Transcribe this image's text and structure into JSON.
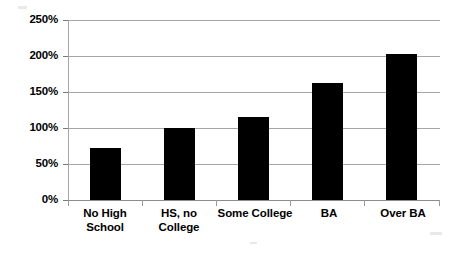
{
  "chart_data": {
    "type": "bar",
    "title": "",
    "xlabel": "",
    "ylabel": "",
    "categories": [
      "No High School",
      "HS, no College",
      "Some College",
      "BA",
      "Over BA"
    ],
    "values": [
      72,
      100,
      115,
      162,
      203
    ],
    "value_unit": "%",
    "ylim": [
      0,
      250
    ],
    "ytick_step": 50,
    "ytick_labels": [
      "0%",
      "50%",
      "100%",
      "150%",
      "200%",
      "250%"
    ],
    "ytick_values": [
      0,
      50,
      100,
      150,
      200,
      250
    ],
    "grid": true,
    "grid_axis": "y",
    "legend": false,
    "legend_position": "none",
    "series": [
      {
        "name": "",
        "color": "#000000",
        "values": [
          72,
          100,
          115,
          162,
          203
        ]
      }
    ]
  },
  "axis": {
    "y_labels": [
      {
        "text": "250%",
        "value": 250
      },
      {
        "text": "200%",
        "value": 200
      },
      {
        "text": "150%",
        "value": 150
      },
      {
        "text": "100%",
        "value": 100
      },
      {
        "text": "50%",
        "value": 50
      },
      {
        "text": "0%",
        "value": 0
      }
    ],
    "x_labels": [
      {
        "line1": "No High",
        "line2": "School"
      },
      {
        "line1": "HS, no",
        "line2": "College"
      },
      {
        "line1": "Some College",
        "line2": ""
      },
      {
        "line1": "BA",
        "line2": ""
      },
      {
        "line1": "Over BA",
        "line2": ""
      }
    ]
  },
  "colors": {
    "bar": "#000000",
    "gridline": "#a6a6a6",
    "axis": "#8c8c8c",
    "text": "#000000",
    "background": "#ffffff"
  }
}
